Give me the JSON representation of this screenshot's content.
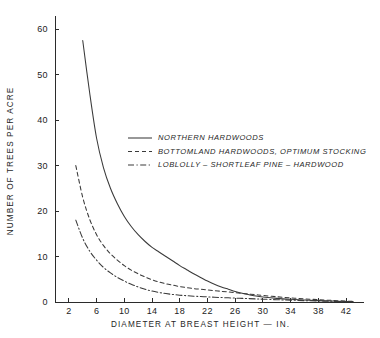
{
  "chart_data": {
    "type": "line",
    "title": "",
    "xlabel": "DIAMETER AT BREAST HEIGHT — IN.",
    "ylabel": "NUMBER OF TREES PER ACRE",
    "xlim": [
      0,
      44
    ],
    "ylim": [
      0,
      62
    ],
    "grid": false,
    "legend_position": "upper-right-inside",
    "xticks": [
      2,
      6,
      10,
      14,
      18,
      22,
      26,
      30,
      34,
      38,
      42
    ],
    "xtick_labels": [
      "2",
      "6",
      "10",
      "14",
      "18",
      "22",
      "26",
      "30",
      "34",
      "38",
      "42"
    ],
    "yticks": [
      0,
      10,
      20,
      30,
      40,
      50,
      60
    ],
    "ytick_labels": [
      "0",
      "10",
      "20",
      "30",
      "40",
      "50",
      "60"
    ],
    "series": [
      {
        "name": "NORTHERN HARDWOODS",
        "style": "solid",
        "dash": "none",
        "color": "#3a3a3a",
        "x": [
          4,
          5,
          6,
          7,
          8,
          9,
          10,
          11,
          12,
          13,
          14,
          15,
          16,
          17,
          18,
          19,
          20,
          21,
          22,
          23,
          24,
          25,
          26,
          27,
          28,
          29,
          30,
          32,
          34,
          36,
          38,
          40,
          42,
          43
        ],
        "y": [
          57.5,
          46.0,
          36.0,
          29.5,
          25.0,
          21.6,
          18.8,
          16.6,
          14.8,
          13.3,
          12.0,
          11.0,
          10.0,
          9.0,
          8.0,
          7.1,
          6.2,
          5.4,
          4.6,
          3.9,
          3.3,
          2.8,
          2.3,
          1.9,
          1.6,
          1.3,
          1.1,
          0.8,
          0.6,
          0.45,
          0.3,
          0.2,
          0.12,
          0.1
        ]
      },
      {
        "name": "BOTTOMLAND HARDWOODS, OPTIMUM STOCKING",
        "style": "dashed",
        "dash": "4,3",
        "color": "#3a3a3a",
        "x": [
          3,
          4,
          5,
          6,
          7,
          8,
          9,
          10,
          11,
          12,
          13,
          14,
          15,
          16,
          17,
          18,
          19,
          20,
          21,
          22,
          23,
          24,
          25,
          26,
          27,
          28,
          29,
          30,
          32,
          34,
          36,
          38,
          40,
          42,
          43
        ],
        "y": [
          30.0,
          23.0,
          18.2,
          14.8,
          12.4,
          10.6,
          9.2,
          8.0,
          7.0,
          6.2,
          5.5,
          4.9,
          4.4,
          4.0,
          3.7,
          3.4,
          3.15,
          2.95,
          2.8,
          2.65,
          2.5,
          2.35,
          2.2,
          2.05,
          1.9,
          1.75,
          1.6,
          1.45,
          1.15,
          0.9,
          0.7,
          0.5,
          0.35,
          0.2,
          0.15
        ]
      },
      {
        "name": "LOBLOLLY – SHORTLEAF PINE – HARDWOOD",
        "style": "dash-dot",
        "dash": "6,2.5,1.2,2.5",
        "color": "#3a3a3a",
        "x": [
          3,
          4,
          5,
          6,
          7,
          8,
          9,
          10,
          11,
          12,
          13,
          14,
          15,
          16,
          17,
          18,
          19,
          20,
          21,
          22,
          23,
          24,
          25,
          26,
          27,
          28,
          29,
          30,
          32,
          34,
          36,
          38,
          40,
          42,
          43
        ],
        "y": [
          18.0,
          14.0,
          11.2,
          9.2,
          7.6,
          6.4,
          5.4,
          4.6,
          3.9,
          3.3,
          2.8,
          2.4,
          2.1,
          1.85,
          1.65,
          1.5,
          1.38,
          1.28,
          1.2,
          1.12,
          1.05,
          0.98,
          0.92,
          0.86,
          0.8,
          0.74,
          0.68,
          0.62,
          0.5,
          0.4,
          0.3,
          0.22,
          0.15,
          0.1,
          0.08
        ]
      }
    ],
    "legend_entries": [
      "NORTHERN HARDWOODS",
      "BOTTOMLAND HARDWOODS, OPTIMUM STOCKING",
      "LOBLOLLY – SHORTLEAF PINE – HARDWOOD"
    ]
  }
}
